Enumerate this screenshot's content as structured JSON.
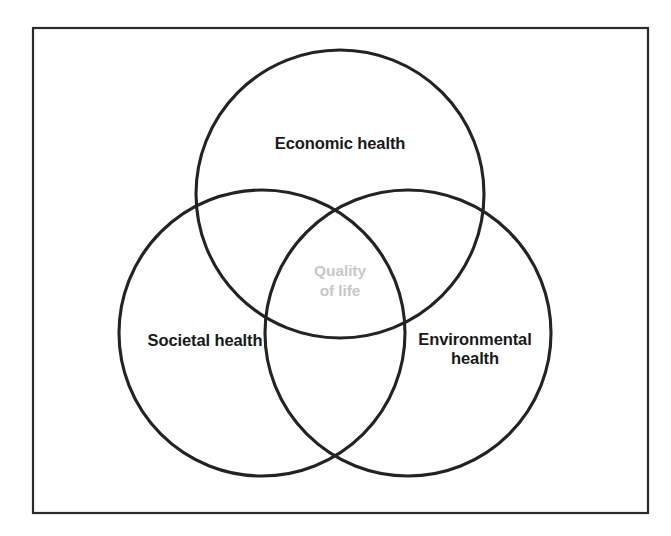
{
  "diagram": {
    "type": "venn",
    "title": "",
    "frame": {
      "visible": true,
      "color": "#2b2b2b"
    },
    "circle_color": "#232323",
    "center_label_color": "#c7c7c7",
    "sets": [
      {
        "id": "economic",
        "label": "Economic health",
        "position": "top",
        "center": [
          340,
          194
        ],
        "radius": 144
      },
      {
        "id": "societal",
        "label": "Societal health",
        "position": "bottom-left",
        "center": [
          262,
          333
        ],
        "radius": 143
      },
      {
        "id": "environmental",
        "label": "Environmental\nhealth",
        "position": "bottom-right",
        "center": [
          408,
          333
        ],
        "radius": 143
      }
    ],
    "intersection": {
      "id": "quality-of-life",
      "label": "Quality\nof life",
      "position": "center"
    }
  }
}
